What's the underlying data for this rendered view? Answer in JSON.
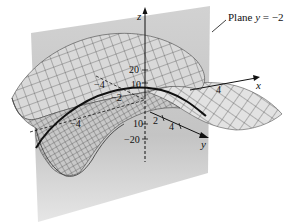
{
  "figure": {
    "type": "3d-surface-plot",
    "annotation": {
      "text": "Plane y = −2",
      "prefix": "Plane ",
      "variable": "y",
      "equation_rest": " = −2"
    },
    "axes": {
      "x": {
        "label": "x",
        "ticks": [
          "−4",
          "−2",
          "2",
          "4"
        ]
      },
      "y": {
        "label": "y",
        "ticks": [
          "−4",
          "−2",
          "2",
          "4"
        ]
      },
      "z": {
        "label": "z",
        "ticks": [
          "20",
          "10",
          "−10",
          "−20"
        ]
      }
    },
    "tick_labels": {
      "z20": "20",
      "z10": "10",
      "zm10": "10",
      "zm20": "−20",
      "xm4": "−4",
      "xm2": "−2",
      "y2": "2",
      "y4": "4",
      "left_m4": "−4",
      "x4": "4"
    },
    "colors": {
      "plane": "#c9c9c9",
      "surface": "#d8d8d8",
      "mesh": "#3a3a3a",
      "trace_curve": "#111111",
      "axis": "#111111"
    }
  }
}
